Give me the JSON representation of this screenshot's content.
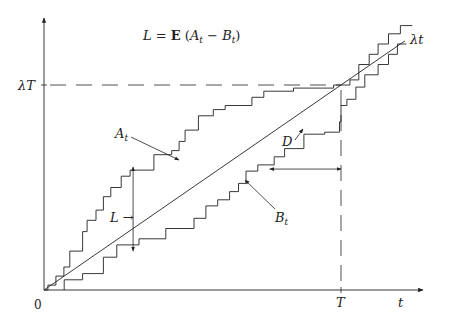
{
  "diagram": {
    "title_formula": {
      "lhs": "L",
      "eq": " = ",
      "op": "E",
      "open": " (",
      "a": "A",
      "a_sub": "t",
      "minus": " − ",
      "b": "B",
      "b_sub": "t",
      "close": ")"
    },
    "labels": {
      "origin": "0",
      "x_axis": "t",
      "T_tick": "T",
      "lambdaT_tick": "λT",
      "lambda_t_line": "λt",
      "A_curve": "A",
      "A_sub": "t",
      "B_curve": "B",
      "B_sub": "t",
      "L_marker": "L →",
      "D_marker": "D"
    },
    "axes": {
      "t_max": 1.27,
      "v_max": 1.32,
      "T": 1.0,
      "lambdaT": 1.0
    },
    "lambda_line": {
      "t_end": 1.215
    },
    "A_steps": [
      [
        0.0,
        0.0
      ],
      [
        0.013,
        0.024
      ],
      [
        0.04,
        0.068
      ],
      [
        0.067,
        0.112
      ],
      [
        0.087,
        0.19
      ],
      [
        0.13,
        0.285
      ],
      [
        0.145,
        0.34
      ],
      [
        0.175,
        0.39
      ],
      [
        0.2,
        0.455
      ],
      [
        0.225,
        0.5
      ],
      [
        0.26,
        0.555
      ],
      [
        0.29,
        0.585
      ],
      [
        0.37,
        0.66
      ],
      [
        0.43,
        0.68
      ],
      [
        0.455,
        0.725
      ],
      [
        0.475,
        0.78
      ],
      [
        0.52,
        0.85
      ],
      [
        0.57,
        0.88
      ],
      [
        0.61,
        0.9
      ],
      [
        0.7,
        0.94
      ],
      [
        0.74,
        0.97
      ],
      [
        0.84,
        0.985
      ],
      [
        0.975,
        1.0
      ],
      [
        1.03,
        1.025
      ],
      [
        1.06,
        1.1
      ],
      [
        1.095,
        1.15
      ],
      [
        1.125,
        1.2
      ],
      [
        1.16,
        1.25
      ],
      [
        1.2,
        1.29
      ],
      [
        1.24,
        1.29
      ]
    ],
    "B_steps": [
      [
        0.068,
        0.0
      ],
      [
        0.068,
        0.05
      ],
      [
        0.13,
        0.08
      ],
      [
        0.2,
        0.16
      ],
      [
        0.245,
        0.22
      ],
      [
        0.32,
        0.25
      ],
      [
        0.41,
        0.3
      ],
      [
        0.505,
        0.35
      ],
      [
        0.545,
        0.41
      ],
      [
        0.585,
        0.44
      ],
      [
        0.625,
        0.48
      ],
      [
        0.655,
        0.52
      ],
      [
        0.68,
        0.58
      ],
      [
        0.72,
        0.61
      ],
      [
        0.775,
        0.65
      ],
      [
        0.81,
        0.69
      ],
      [
        0.875,
        0.76
      ],
      [
        0.945,
        0.77
      ],
      [
        0.995,
        0.82
      ],
      [
        1.0,
        0.9
      ],
      [
        1.02,
        0.93
      ],
      [
        1.05,
        0.99
      ],
      [
        1.08,
        1.05
      ],
      [
        1.125,
        1.1
      ],
      [
        1.16,
        1.15
      ],
      [
        1.19,
        1.2
      ],
      [
        1.22,
        1.2
      ]
    ],
    "L_marker": {
      "t": 0.3,
      "v_top": 0.6,
      "v_bottom": 0.19
    },
    "D_marker": {
      "v": 0.59,
      "t_left": 0.76,
      "t_right": 1.0
    },
    "colors": {
      "ink": "#222222",
      "background": "#ffffff"
    }
  }
}
